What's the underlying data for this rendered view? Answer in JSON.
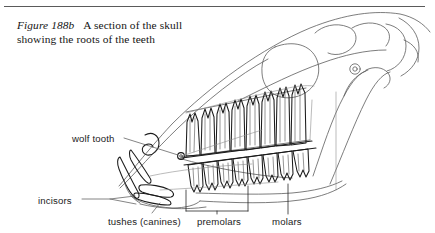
{
  "page": {
    "background_color": "#ffffff",
    "ink_color": "#1b1b1b",
    "rule_color": "#5a5a5a"
  },
  "caption": {
    "figure_number": "Figure 188b",
    "text": "A section of the skull showing the roots of the teeth",
    "full": "Figure 188b    A section of the skull showing the roots of the teeth"
  },
  "figure": {
    "title": "A section of the skull showing the roots of the teeth",
    "labels": [
      {
        "id": "wolf-tooth",
        "text": "wolf tooth"
      },
      {
        "id": "incisors",
        "text": "incisors"
      },
      {
        "id": "tushes",
        "text": "tushes (canines)"
      },
      {
        "id": "premolars",
        "text": "premolars"
      },
      {
        "id": "molars",
        "text": "molars"
      }
    ]
  }
}
